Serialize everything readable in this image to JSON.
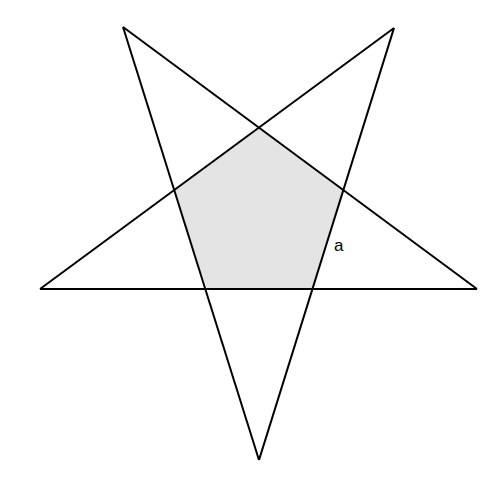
{
  "diagram": {
    "type": "pentagram",
    "width": 502,
    "height": 483,
    "stroke_color": "#000000",
    "stroke_width": 2,
    "shade_color": "#e4e4e4",
    "outer_vertices": {
      "top_left": [
        123,
        27
      ],
      "top_right": [
        394,
        28
      ],
      "left": [
        40,
        289
      ],
      "right": [
        477,
        289
      ],
      "bottom": [
        259,
        460
      ]
    },
    "inner_pentagon": {
      "top": [
        260,
        127
      ],
      "right": [
        343,
        191
      ],
      "bottom_right": [
        312,
        289
      ],
      "bottom_left": [
        207,
        289
      ],
      "left": [
        174,
        191
      ],
      "shaded": true
    },
    "labels": [
      {
        "text": "a",
        "x": 334,
        "y": 251,
        "refers_to": "right side of inner pentagon"
      }
    ]
  }
}
